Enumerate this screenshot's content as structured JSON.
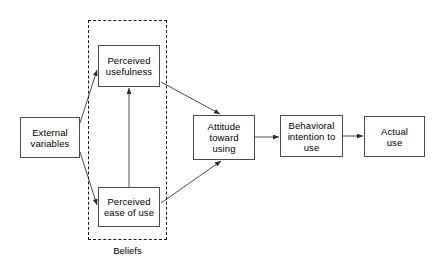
{
  "diagram": {
    "stroke_color": "#4c4c4c",
    "dash_color": "#1a1a1a",
    "background": "#ffffff",
    "nodes": [
      {
        "id": "external-variables",
        "label": "External\nvariables",
        "x": 20,
        "y": 117,
        "w": 60,
        "h": 41
      },
      {
        "id": "perceived-usefulness",
        "label": "Perceived\nusefulness",
        "x": 98,
        "y": 45,
        "w": 62,
        "h": 42
      },
      {
        "id": "perceived-ease-of-use",
        "label": "Perceived\nease of use",
        "x": 98,
        "y": 187,
        "w": 62,
        "h": 40
      },
      {
        "id": "attitude-toward-using",
        "label": "Attitude\ntoward\nusing",
        "x": 193,
        "y": 115,
        "w": 62,
        "h": 45
      },
      {
        "id": "behavioral-intention-to-use",
        "label": "Behavioral\nintention to\nuse",
        "x": 280,
        "y": 115,
        "w": 63,
        "h": 42
      },
      {
        "id": "actual-use",
        "label": "Actual\nuse",
        "x": 364,
        "y": 116,
        "w": 61,
        "h": 41
      }
    ],
    "group": {
      "id": "beliefs-group",
      "caption": "Beliefs",
      "x": 88,
      "y": 20,
      "w": 79,
      "h": 220,
      "caption_x": 88,
      "caption_y": 245,
      "caption_w": 79
    },
    "edges": [
      {
        "id": "external-to-usefulness",
        "from": "external-variables",
        "to": "perceived-usefulness",
        "x1": 80,
        "y1": 123,
        "x2": 97,
        "y2": 70
      },
      {
        "id": "external-to-ease",
        "from": "external-variables",
        "to": "perceived-ease-of-use",
        "x1": 80,
        "y1": 152,
        "x2": 97,
        "y2": 205
      },
      {
        "id": "ease-to-usefulness",
        "from": "perceived-ease-of-use",
        "to": "perceived-usefulness",
        "x1": 129,
        "y1": 187,
        "x2": 129,
        "y2": 88
      },
      {
        "id": "usefulness-to-attitude",
        "from": "perceived-usefulness",
        "to": "attitude-toward-using",
        "x1": 161,
        "y1": 82,
        "x2": 220,
        "y2": 114
      },
      {
        "id": "ease-to-attitude",
        "from": "perceived-ease-of-use",
        "to": "attitude-toward-using",
        "x1": 161,
        "y1": 203,
        "x2": 221,
        "y2": 161
      },
      {
        "id": "attitude-to-intention",
        "from": "attitude-toward-using",
        "to": "behavioral-intention-to-use",
        "x1": 255,
        "y1": 137,
        "x2": 279,
        "y2": 137
      },
      {
        "id": "intention-to-actual",
        "from": "behavioral-intention-to-use",
        "to": "actual-use",
        "x1": 343,
        "y1": 136,
        "x2": 363,
        "y2": 136
      }
    ]
  }
}
